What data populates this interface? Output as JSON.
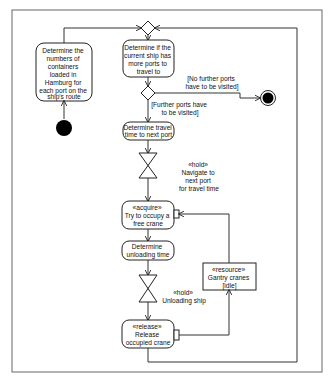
{
  "diagram": {
    "type": "uml-activity",
    "nodes": {
      "initial": {
        "label": ""
      },
      "determine_containers": {
        "lines": [
          "Determine the",
          "numbers of",
          "containers",
          "loaded in",
          "Hamburg for",
          "each port on the",
          "ship's route"
        ]
      },
      "merge": {
        "label": ""
      },
      "check_ports": {
        "lines": [
          "Determine if the",
          "current ship has",
          "more ports to",
          "travel to"
        ]
      },
      "decision": {
        "label": ""
      },
      "final": {
        "label": ""
      },
      "travel_time": {
        "lines": [
          "Determine travel",
          "time to next port"
        ]
      },
      "hold_navigate": {
        "lines": [
          "«hold»",
          "Navigate to",
          "next port",
          "for travel time"
        ]
      },
      "acquire": {
        "lines": [
          "«acquire»",
          "Try to occupy a",
          "free crane"
        ]
      },
      "unloading_time": {
        "lines": [
          "Determine",
          "unloading time"
        ]
      },
      "hold_unload": {
        "lines": [
          "«hold»",
          "Unloading ship"
        ]
      },
      "release": {
        "lines": [
          "«release»",
          "Release",
          "occupied crane"
        ]
      },
      "resource": {
        "lines": [
          "«resource»",
          "Gantry cranes",
          "[idle]"
        ]
      }
    },
    "guards": {
      "no_more": {
        "lines": [
          "[No further ports",
          "have to be visited]"
        ]
      },
      "more": {
        "lines": [
          "[Further ports have",
          "to be visited]"
        ]
      }
    },
    "colors": {
      "line": "#333333",
      "fill": "#ffffff",
      "node": "#000000",
      "frame": "#666666"
    }
  }
}
